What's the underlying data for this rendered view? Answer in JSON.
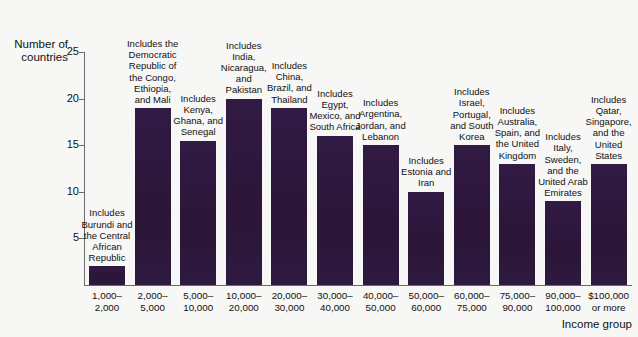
{
  "chart_data": {
    "type": "bar",
    "title": "",
    "xlabel": "Income group",
    "ylabel": "Number of countries",
    "ylim": [
      0,
      26
    ],
    "yticks": [
      5,
      10,
      15,
      20,
      25
    ],
    "grid": false,
    "legend": "none",
    "bar_color": "#2e1840",
    "background_color": "#f7f7f5",
    "categories": [
      "1,000–\n2,000",
      "2,000–\n5,000",
      "5,000–\n10,000",
      "10,000–\n20,000",
      "20,000–\n30,000",
      "30,000–\n40,000",
      "40,000–\n50,000",
      "50,000–\n60,000",
      "60,000–\n75,000",
      "75,000–\n90,000",
      "90,000–\n100,000",
      "$100,000\nor more"
    ],
    "values": [
      2,
      19,
      15.5,
      20,
      19,
      16,
      15,
      10,
      15,
      13,
      9,
      13
    ],
    "annotations": [
      "Includes Burundi and the Central African Republic",
      "Includes the Democratic Republic of the Congo, Ethiopia, and Mali",
      "Includes Kenya, Ghana, and Senegal",
      "Includes India, Nicaragua, and Pakistan",
      "Includes China, Brazil, and Thailand",
      "Includes Egypt, Mexico, and South Africa",
      "Includes Argentina, Jordan, and Lebanon",
      "Includes Estonia and Iran",
      "Includes Israel, Portugal, and South Korea",
      "Includes Australia, Spain, and the United Kingdom",
      "Includes Italy, Sweden, and the United Arab Emirates",
      "Includes Qatar, Singapore, and the United States"
    ]
  },
  "axes": {
    "y_title": "Number of\ncountries",
    "x_title": "Income group",
    "y_tick_labels": [
      "25",
      "20",
      "15",
      "10",
      "5"
    ]
  }
}
